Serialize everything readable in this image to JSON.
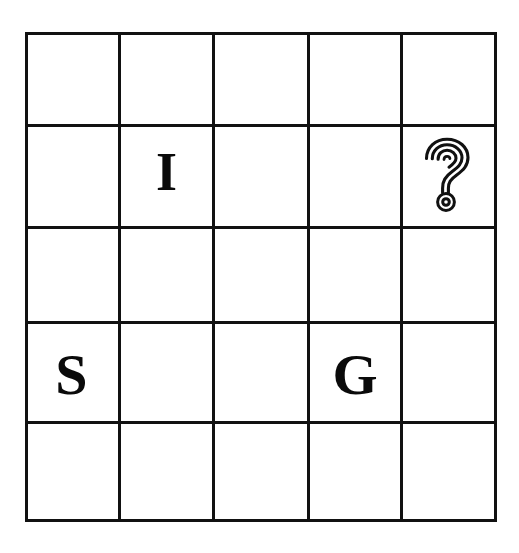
{
  "board": {
    "type": "grid-puzzle",
    "rows": 5,
    "columns": 5,
    "background_color": "#ffffff",
    "line_color": "#111111",
    "letter_color": "#0a0a0a",
    "cells": [
      [
        {
          "row": 1,
          "col": 1,
          "label": ""
        },
        {
          "row": 1,
          "col": 2,
          "label": ""
        },
        {
          "row": 1,
          "col": 3,
          "label": ""
        },
        {
          "row": 1,
          "col": 4,
          "label": ""
        },
        {
          "row": 1,
          "col": 5,
          "label": ""
        }
      ],
      [
        {
          "row": 2,
          "col": 1,
          "label": ""
        },
        {
          "row": 2,
          "col": 2,
          "label": "I"
        },
        {
          "row": 2,
          "col": 3,
          "label": ""
        },
        {
          "row": 2,
          "col": 4,
          "label": ""
        },
        {
          "row": 2,
          "col": 5,
          "label": "?",
          "icon": "question-mark-icon"
        }
      ],
      [
        {
          "row": 3,
          "col": 1,
          "label": ""
        },
        {
          "row": 3,
          "col": 2,
          "label": ""
        },
        {
          "row": 3,
          "col": 3,
          "label": ""
        },
        {
          "row": 3,
          "col": 4,
          "label": ""
        },
        {
          "row": 3,
          "col": 5,
          "label": ""
        }
      ],
      [
        {
          "row": 4,
          "col": 1,
          "label": "S"
        },
        {
          "row": 4,
          "col": 2,
          "label": ""
        },
        {
          "row": 4,
          "col": 3,
          "label": ""
        },
        {
          "row": 4,
          "col": 4,
          "label": "G"
        },
        {
          "row": 4,
          "col": 5,
          "label": ""
        }
      ],
      [
        {
          "row": 5,
          "col": 1,
          "label": ""
        },
        {
          "row": 5,
          "col": 2,
          "label": ""
        },
        {
          "row": 5,
          "col": 3,
          "label": ""
        },
        {
          "row": 5,
          "col": 4,
          "label": ""
        },
        {
          "row": 5,
          "col": 5,
          "label": ""
        }
      ]
    ]
  }
}
